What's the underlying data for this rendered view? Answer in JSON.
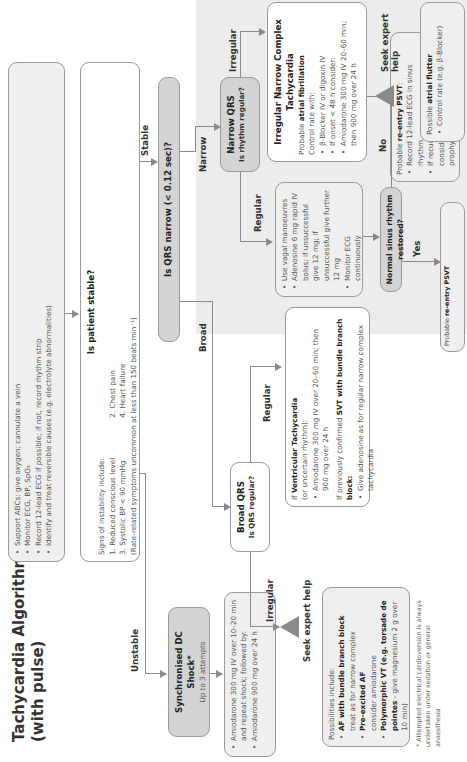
{
  "title": {
    "line1": "Tachycardia Algorithm",
    "line2": "(with pulse)"
  },
  "initial": {
    "items": [
      "Support ABCs: give oxygen; cannulate a vein",
      "Monitor ECG, BP, SpO₂",
      "Record 12-lead ECG if possible; if not, record rhythm strip",
      "Identify and treat reversible causes (e.g. electrolyte abnormalities)"
    ]
  },
  "stable_q": {
    "title": "Is patient stable?",
    "intro": "Signs of instability include:",
    "signs": [
      "1. Reduced conscious level",
      "2. Chest pain",
      "3. Systolic BP < 90 mmHg",
      "4. Heart failure"
    ],
    "note": "(Rate-related symptoms uncommon at less than 150 beats min⁻¹)"
  },
  "labels": {
    "unstable": "Unstable",
    "stable": "Stable",
    "broad": "Broad",
    "narrow": "Narrow",
    "regular_broad": "Regular",
    "irregular_broad": "Irregular",
    "regular_narrow": "Regular",
    "irregular_narrow": "Irregular",
    "yes": "Yes",
    "no": "No"
  },
  "dc_shock": {
    "title": "Synchronised DC Shock*",
    "sub": "Up to 3 attempts"
  },
  "amio_unstable": {
    "items": [
      "Amiodarone 300 mg IV over 10–20 min and repeat shock; followed by:",
      "Amiodarone 900 mg over 24 h"
    ]
  },
  "qrs_q": {
    "title": "Is QRS narrow (< 0.12 sec)?"
  },
  "broad_qrs": {
    "title": "Broad QRS",
    "sub": "Is QRS regular?"
  },
  "narrow_qrs": {
    "title": "Narrow QRS",
    "sub": "Is rhythm regular?"
  },
  "seek_help": {
    "label": "Seek expert help"
  },
  "broad_irregular": {
    "intro": "Possibilities include:",
    "items": [
      {
        "bold": "AF with bundle branch block",
        "text": "treat as for narrow complex"
      },
      {
        "bold": "Pre-excited AF",
        "text": "consider amiodarone"
      },
      {
        "bold": "Polymorphic VT (e.g. torsade de pointes",
        "text": "- give magnesium 2 g over 10 min)"
      }
    ]
  },
  "broad_regular": {
    "vt_prefix": "If ",
    "vt_bold": "Ventricular Tachycardia",
    "vt_sub": "(or uncertain rhythm):",
    "vt_items": [
      "Amiodarone 300 mg IV over 20–60 min; then 900 mg over 24 h"
    ],
    "svt_prefix": "If previously confirmed ",
    "svt_bold": "SVT with bundle branch block:",
    "svt_items": [
      "Give adenosine as for regular narrow complex tachycardia"
    ]
  },
  "narrow_regular": {
    "items": [
      "Use vagal manoeuvres",
      "Adenosine 6 mg rapid IV bolus; if unsuccessful give 12 mg; if unsuccessful give further 12 mg",
      "Monitor ECG continuously"
    ]
  },
  "nsr_q": {
    "title": "Normal sinus rhythm restored?"
  },
  "psvt": {
    "prefix": "Probable ",
    "bold": "re-entry PSVT",
    "items": [
      "Record 12-lead ECG in sinus rhythm",
      "If recurs, give adenosine again & consider choice of anti-arrhythmic prophylaxis"
    ]
  },
  "irregular_narrow": {
    "title": "Irregular Narrow Complex Tachycardia",
    "prob_prefix": "Probable ",
    "prob_bold": "atrial fibrillation",
    "control": "Control rate with:",
    "items": [
      "β-Blocker IV or digoxin IV",
      "If onset < 48 h consider:",
      "Amiodarone 300 mg IV 20–60 min; then 900 mg over 24 h"
    ]
  },
  "flutter": {
    "prefix": "Possible ",
    "bold": "atrial flutter",
    "items": [
      "Control rate (e.g. β-Blocker)"
    ]
  },
  "footnote": "* Attempted electrical cardioversion is always undertaken under sedation or general anaesthesia"
}
